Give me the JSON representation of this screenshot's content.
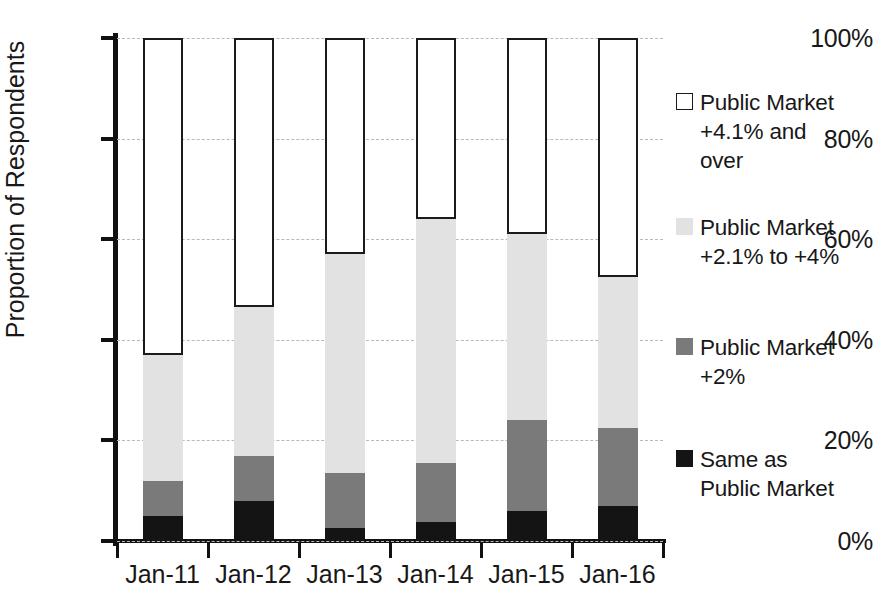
{
  "chart_data": {
    "type": "bar",
    "subtype": "stacked-bar-100",
    "title": "",
    "xlabel": "",
    "ylabel": "Proportion of Respondents",
    "categories": [
      "Jan-11",
      "Jan-12",
      "Jan-13",
      "Jan-14",
      "Jan-15",
      "Jan-16"
    ],
    "ylim": [
      0,
      100
    ],
    "ytick_labels": [
      "0%",
      "20%",
      "40%",
      "60%",
      "80%",
      "100%"
    ],
    "ytick_values": [
      0,
      20,
      40,
      60,
      80,
      100
    ],
    "grid": true,
    "legend_position": "right",
    "series": [
      {
        "name": "Same as Public Market",
        "legend_label": "Same as\nPublic Market",
        "color": "#141414",
        "values": [
          5,
          8,
          2.5,
          3.7,
          6,
          7
        ]
      },
      {
        "name": "Public Market +2%",
        "legend_label": "Public Market\n+2%",
        "color": "#7a7a7a",
        "values": [
          7,
          9,
          11,
          11.8,
          18,
          15.5
        ]
      },
      {
        "name": "Public Market +2.1% to +4%",
        "legend_label": "Public Market\n+2.1% to +4%",
        "color": "#e2e2e2",
        "values": [
          25,
          29.5,
          43.5,
          48.5,
          37,
          30
        ]
      },
      {
        "name": "Public Market +4.1% and over",
        "legend_label": "Public Market\n+4.1% and\nover",
        "color": "#ffffff",
        "border_color": "#1b1b1b",
        "values": [
          63,
          53.5,
          43,
          36,
          39,
          47.5
        ]
      }
    ],
    "cumulative_tops": {
      "Jan-11": [
        5,
        12,
        37,
        100
      ],
      "Jan-12": [
        8,
        17,
        46.5,
        100
      ],
      "Jan-13": [
        2.5,
        13.5,
        57,
        100
      ],
      "Jan-14": [
        3.7,
        15.5,
        64,
        100
      ],
      "Jan-15": [
        6,
        24,
        61,
        100
      ],
      "Jan-16": [
        7,
        22.5,
        52.5,
        100
      ]
    }
  }
}
